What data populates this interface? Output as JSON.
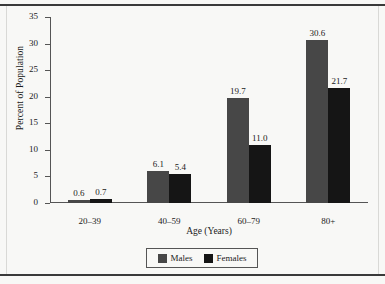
{
  "chart_data": {
    "type": "bar",
    "title": "",
    "subtitle": "",
    "xlabel": "Age (Years)",
    "ylabel": "Percent of Population",
    "categories": [
      "20–39",
      "40–59",
      "60–79",
      "80+"
    ],
    "series": [
      {
        "name": "Males",
        "color": "#474747",
        "values": [
          0.6,
          6.1,
          19.7,
          30.6
        ],
        "labels": [
          "0.6",
          "6.1",
          "19.7",
          "30.6"
        ]
      },
      {
        "name": "Females",
        "color": "#151515",
        "values": [
          0.7,
          5.4,
          11.0,
          21.7
        ],
        "labels": [
          "0.7",
          "5.4",
          "11.0",
          "21.7"
        ]
      }
    ],
    "ylim": [
      0,
      35
    ],
    "yticks": [
      0,
      5,
      10,
      15,
      20,
      25,
      30,
      35
    ],
    "ytick_labels": [
      "0",
      "5",
      "10",
      "15",
      "20",
      "25",
      "30",
      "35"
    ],
    "grid": false,
    "legend_position": "bottom-center",
    "legend_entries": [
      "Males",
      "Females"
    ]
  },
  "legend": {
    "items": [
      {
        "label": "Males",
        "color": "#474747"
      },
      {
        "label": "Females",
        "color": "#151515"
      }
    ]
  },
  "page": {
    "background": "#f8f8f6",
    "rule_color": "#3a3a3a"
  }
}
